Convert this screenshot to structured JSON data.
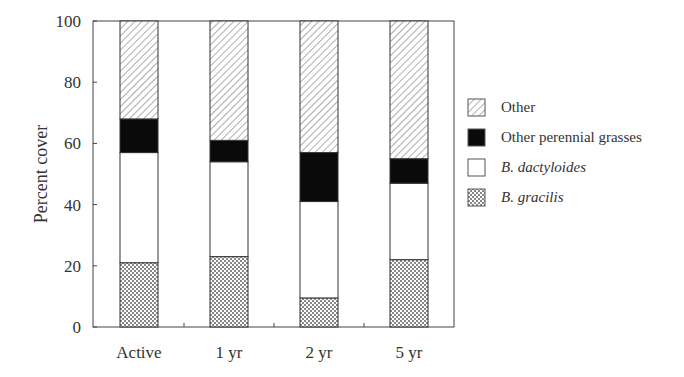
{
  "chart_data": {
    "type": "bar",
    "stacked": true,
    "title": "",
    "xlabel": "",
    "ylabel": "Percent cover",
    "ylim": [
      0,
      100
    ],
    "yticks": [
      0,
      20,
      40,
      60,
      80,
      100
    ],
    "grid": false,
    "legend_position": "right",
    "categories": [
      "Active",
      "1 yr",
      "2 yr",
      "5 yr"
    ],
    "series": [
      {
        "name": "B. gracilis",
        "italic": true,
        "pattern": "crosshatch",
        "values": [
          21,
          23,
          9.5,
          22
        ]
      },
      {
        "name": "B. dactyloides",
        "italic": true,
        "pattern": "white",
        "values": [
          36,
          31,
          31.5,
          25
        ]
      },
      {
        "name": "Other perennial grasses",
        "italic": false,
        "pattern": "black",
        "values": [
          11,
          7,
          16,
          8
        ]
      },
      {
        "name": "Other",
        "italic": false,
        "pattern": "diagonal",
        "values": [
          32,
          39,
          43,
          45
        ]
      }
    ],
    "legend_order": [
      "Other",
      "Other perennial grasses",
      "B. dactyloides",
      "B. gracilis"
    ]
  },
  "colors": {
    "frame": "#444444",
    "black_fill": "#0a0a0a",
    "hatch": "#777777"
  }
}
